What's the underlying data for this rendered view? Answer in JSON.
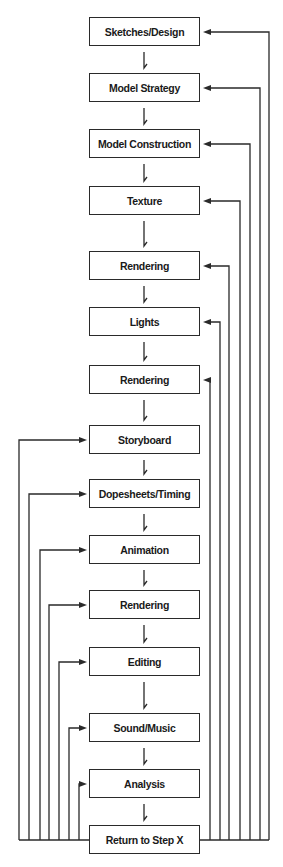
{
  "diagram": {
    "type": "flowchart",
    "nodes": [
      {
        "id": "n1",
        "label": "Sketches/Design",
        "top": 17,
        "return_side": "right",
        "return_x": 269
      },
      {
        "id": "n2",
        "label": "Model Strategy",
        "top": 73,
        "return_side": "right",
        "return_x": 260
      },
      {
        "id": "n3",
        "label": "Model Construction",
        "top": 129,
        "return_side": "right",
        "return_x": 250
      },
      {
        "id": "n4",
        "label": "Texture",
        "top": 186,
        "return_side": "right",
        "return_x": 240
      },
      {
        "id": "n5",
        "label": "Rendering",
        "top": 251,
        "return_side": "right",
        "return_x": 229
      },
      {
        "id": "n6",
        "label": "Lights",
        "top": 307,
        "return_side": "right",
        "return_x": 220
      },
      {
        "id": "n7",
        "label": "Rendering",
        "top": 365,
        "return_side": "right",
        "return_x": 210
      },
      {
        "id": "n8",
        "label": "Storyboard",
        "top": 425,
        "return_side": "left",
        "return_x": 19
      },
      {
        "id": "n9",
        "label": "Dopesheets/Timing",
        "top": 479,
        "return_side": "left",
        "return_x": 29
      },
      {
        "id": "n10",
        "label": "Animation",
        "top": 535,
        "return_side": "left",
        "return_x": 40
      },
      {
        "id": "n11",
        "label": "Rendering",
        "top": 590,
        "return_side": "left",
        "return_x": 49
      },
      {
        "id": "n12",
        "label": "Editing",
        "top": 647,
        "return_side": "left",
        "return_x": 59
      },
      {
        "id": "n13",
        "label": "Sound/Music",
        "top": 713,
        "return_side": "left",
        "return_x": 69
      },
      {
        "id": "n14",
        "label": "Analysis",
        "top": 769,
        "return_side": "left",
        "return_x": 79
      },
      {
        "id": "n15",
        "label": "Return to Step X",
        "top": 825,
        "return_side": "none"
      }
    ],
    "edges_note": "Sequential downward arrows between each step; 'Return to Step X' loops back to every prior step via side lines",
    "colors": {
      "line": "#2a2a2a",
      "box_border": "#2a2a2a",
      "text": "#1a1a1a",
      "background": "#ffffff"
    }
  }
}
